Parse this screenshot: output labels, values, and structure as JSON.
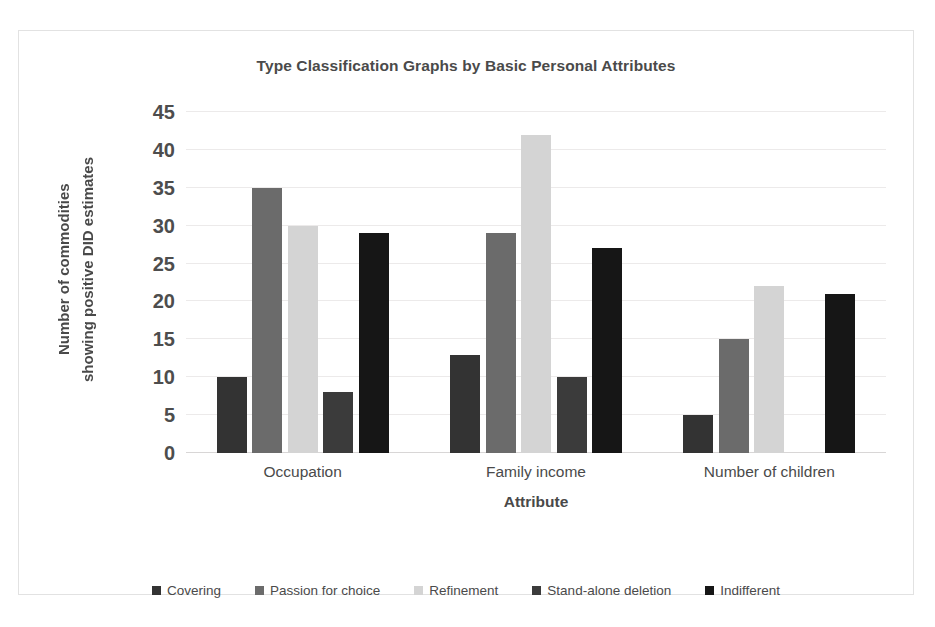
{
  "chart_data": {
    "type": "bar",
    "title": "Type Classification Graphs by Basic Personal Attributes",
    "xlabel": "Attribute",
    "ylabel_line1": "Number of commodities",
    "ylabel_line2": "showing positive DID estimates",
    "categories": [
      "Occupation",
      "Family income",
      "Number of children"
    ],
    "series": [
      {
        "name": "Covering",
        "color": "#333333",
        "values": [
          10,
          13,
          5
        ]
      },
      {
        "name": "Passion for choice",
        "color": "#6b6b6b",
        "values": [
          35,
          29,
          15
        ]
      },
      {
        "name": "Refinement",
        "color": "#d4d4d4",
        "values": [
          30,
          42,
          22
        ]
      },
      {
        "name": "Stand-alone deletion",
        "color": "#3b3b3b",
        "values": [
          8,
          10,
          0
        ]
      },
      {
        "name": "Indifferent",
        "color": "#161616",
        "values": [
          29,
          27,
          21
        ]
      }
    ],
    "ylim": [
      0,
      45
    ],
    "yticks": [
      0,
      5,
      10,
      15,
      20,
      25,
      30,
      35,
      40,
      45
    ],
    "ytick_labels": [
      "0",
      "5",
      "10",
      "15",
      "20",
      "25",
      "30",
      "35",
      "40",
      "45"
    ],
    "grid": true,
    "legend_position": "bottom"
  }
}
